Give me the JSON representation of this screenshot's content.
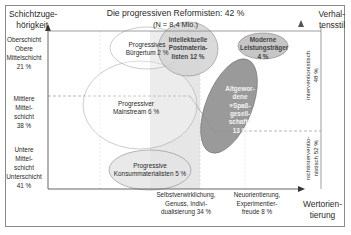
{
  "title": "Die progressiven Reformisten: 42 %",
  "subtitle": "(N = 8,4 Mio.)",
  "y_axis": {
    "label_line1": "Schichtzuge-",
    "label_line2": "hörigkeit",
    "classes": [
      {
        "lines": [
          "Oberschicht",
          "Obere",
          "Mittelschicht",
          "21 %"
        ]
      },
      {
        "lines": [
          "Mittlere",
          "Mittel-",
          "schicht",
          "38 %"
        ]
      },
      {
        "lines": [
          "Untere",
          "Mittel-",
          "schicht",
          "Unterschicht",
          "41 %"
        ]
      }
    ]
  },
  "right_axis": {
    "label_line1": "Verhal-",
    "label_line2": "tensstil",
    "upper": {
      "line1": "interventionistisch",
      "line2": "48 %"
    },
    "lower": {
      "line1": "nichtinterventio-",
      "line2": "nistisch 52 %"
    }
  },
  "x_axis": {
    "label_line1": "Wertorien-",
    "label_line2": "tierung",
    "categories": [
      {
        "lines": [
          "Selbstverwirklichung,",
          "Genuss, Indivi-",
          "dualisierung 34 %"
        ]
      },
      {
        "lines": [
          "Neuorientierung,",
          "Experimentier-",
          "freude 8 %"
        ]
      }
    ]
  },
  "segments": [
    {
      "name": "progressives-buergertum",
      "lines": [
        "Progressives",
        "Bürgertum 2 %"
      ]
    },
    {
      "name": "intellektuelle-postmaterialisten",
      "lines": [
        "Intellektuelle",
        "Postmateria-",
        "listen 12 %"
      ]
    },
    {
      "name": "moderne-leistungstraeger",
      "lines": [
        "Moderne",
        "Leistungsträger",
        "4 %"
      ]
    },
    {
      "name": "progressiver-mainstream",
      "lines": [
        "Progressiver",
        "Mainstream 6 %"
      ]
    },
    {
      "name": "altgewordene-spassgesellschaft",
      "lines": [
        "Altgewor-",
        "dene",
        "»Spaß-",
        "gesell-",
        "schaft«",
        "13 %"
      ]
    },
    {
      "name": "progressive-konsummaterialisten",
      "lines": [
        "Progressive",
        "Konsummaterialisten 5 %"
      ]
    }
  ],
  "colors": {
    "ellipse_light": "#d9d9d9",
    "ellipse_mid": "#bdbdbd",
    "ellipse_dark": "#8f8f8f",
    "shaded_region": "#e8e8e8",
    "axis": "#555555"
  }
}
